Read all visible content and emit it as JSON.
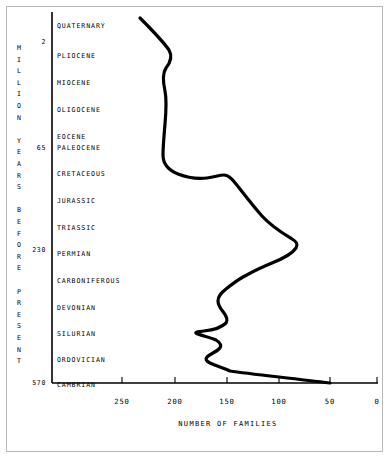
{
  "chart_data": {
    "type": "line",
    "title": "",
    "xlabel": "NUMBER OF FAMILIES",
    "ylabel": "MILLION YEARS BEFORE PRESENT",
    "xlim": [
      250,
      0
    ],
    "x_reversed": true,
    "grid": false,
    "legend": null,
    "xticks": [
      250,
      200,
      150,
      100,
      50,
      0
    ],
    "xtick_labels": [
      "250",
      "200",
      "150",
      "100",
      "50",
      "0"
    ],
    "yticks": [
      2,
      65,
      230,
      570
    ],
    "ytick_labels": [
      "2",
      "65",
      "230",
      "570"
    ],
    "y_categories": [
      "QUATERNARY",
      "PLIOCENE",
      "MIOCENE",
      "OLIGOCENE",
      "EOCENE",
      "PALEOCENE",
      "CRETACEOUS",
      "JURASSIC",
      "TRIASSIC",
      "PERMIAN",
      "CARBONIFEROUS",
      "DEVONIAN",
      "SILURIAN",
      "ORDOVICIAN",
      "CAMBRIAN"
    ],
    "series": [
      {
        "name": "Number of families",
        "points": [
          {
            "period": "QUATERNARY",
            "families": 232
          },
          {
            "period": "QUATERNARY",
            "families": 222
          },
          {
            "period": "PLIOCENE",
            "families": 214
          },
          {
            "period": "PLIOCENE",
            "families": 216
          },
          {
            "period": "MIOCENE",
            "families": 221
          },
          {
            "period": "OLIGOCENE",
            "families": 220
          },
          {
            "period": "EOCENE",
            "families": 215
          },
          {
            "period": "PALEOCENE",
            "families": 211
          },
          {
            "period": "PALEOCENE",
            "families": 206
          },
          {
            "period": "CRETACEOUS",
            "families": 192
          },
          {
            "period": "CRETACEOUS",
            "families": 188
          },
          {
            "period": "CRETACEOUS",
            "families": 186
          },
          {
            "period": "JURASSIC",
            "families": 170
          },
          {
            "period": "JURASSIC",
            "families": 163
          },
          {
            "period": "JURASSIC",
            "families": 159
          },
          {
            "period": "TRIASSIC",
            "families": 146
          },
          {
            "period": "TRIASSIC",
            "families": 132
          },
          {
            "period": "PERMIAN",
            "families": 92
          },
          {
            "period": "PERMIAN",
            "families": 86
          },
          {
            "period": "PERMIAN",
            "families": 104
          },
          {
            "period": "PERMIAN",
            "families": 128
          },
          {
            "period": "CARBONIFEROUS",
            "families": 148
          },
          {
            "period": "CARBONIFEROUS",
            "families": 142
          },
          {
            "period": "CARBONIFEROUS",
            "families": 138
          },
          {
            "period": "DEVONIAN",
            "families": 135
          },
          {
            "period": "DEVONIAN",
            "families": 139
          },
          {
            "period": "DEVONIAN",
            "families": 166
          },
          {
            "period": "SILURIAN",
            "families": 163
          },
          {
            "period": "SILURIAN",
            "families": 141
          },
          {
            "period": "SILURIAN",
            "families": 152
          },
          {
            "period": "ORDOVICIAN",
            "families": 139
          },
          {
            "period": "ORDOVICIAN",
            "families": 158
          },
          {
            "period": "ORDOVICIAN",
            "families": 165
          },
          {
            "period": "CAMBRIAN",
            "families": 120
          },
          {
            "period": "CAMBRIAN",
            "families": 50
          }
        ]
      }
    ],
    "path": "M 140,18 C 150,28 162,40 169,50 C 173,57 170,63 166,68 C 162,74 163,82 165,91 C 167,101 166,112 165,124 C 164,136 163,146 163,155 C 163,163 168,170 178,174 C 188,178 198,179 207,178 C 215,177 219,175 224,175 C 229,175 233,180 240,189 C 247,198 254,207 262,216 C 272,227 284,234 292,239 C 297,242 298,244 296,248 C 292,254 282,259 272,263 C 262,267 252,272 243,277 C 236,281 231,285 226,289 C 221,293 218,296 218,301 C 218,306 221,309 224,313 C 227,317 228,320 226,323 C 222,327 214,330 204,331 C 198,332 195,332 196,333 C 198,335 210,337 216,340 C 221,343 222,346 219,349 C 216,352 210,354 207,357 C 205,359 206,361 210,363 C 216,366 224,368 230,371 C 250,374 290,378 330,383"
  },
  "axis_labels": {
    "vertical_axis_chars": [
      "M",
      "I",
      "L",
      "L",
      "I",
      "O",
      "N",
      "",
      "Y",
      "E",
      "A",
      "R",
      "S",
      "",
      "B",
      "E",
      "F",
      "O",
      "R",
      "E",
      "",
      "P",
      "R",
      "E",
      "S",
      "E",
      "N",
      "T"
    ]
  },
  "colors": {
    "curve": "#000000",
    "axis": "#000000",
    "text": "#000000",
    "frame": "#b9b9b9",
    "background": "#ffffff"
  }
}
